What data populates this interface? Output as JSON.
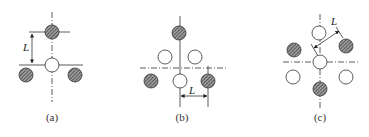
{
  "figure": {
    "background": "#ffffff",
    "line_color": "#333333",
    "hatch_fill": "#6e6e6e",
    "panels": [
      {
        "id": "a",
        "caption": "(a)",
        "caption_pos": [
          52,
          118
        ],
        "dimension": {
          "label": "L",
          "label_pos": [
            27,
            46
          ]
        },
        "circles": [
          {
            "x": 52,
            "y": 32,
            "type": "hatched"
          },
          {
            "x": 52,
            "y": 65,
            "type": "open"
          },
          {
            "x": 26,
            "y": 75,
            "type": "hatched"
          },
          {
            "x": 75,
            "y": 75,
            "type": "hatched"
          }
        ]
      },
      {
        "id": "b",
        "caption": "(b)",
        "caption_pos": [
          182,
          118
        ],
        "dimension": {
          "label": "L",
          "label_pos": [
            190,
            85
          ]
        },
        "circles": [
          {
            "x": 179,
            "y": 33,
            "type": "hatched"
          },
          {
            "x": 165,
            "y": 57,
            "type": "open"
          },
          {
            "x": 195,
            "y": 57,
            "type": "open"
          },
          {
            "x": 151,
            "y": 81,
            "type": "hatched"
          },
          {
            "x": 180,
            "y": 81,
            "type": "open"
          },
          {
            "x": 208,
            "y": 81,
            "type": "hatched"
          }
        ]
      },
      {
        "id": "c",
        "caption": "(c)",
        "caption_pos": [
          320,
          118
        ],
        "dimension": {
          "label": "L",
          "label_pos": [
            332,
            25
          ]
        },
        "circles": [
          {
            "x": 319,
            "y": 33,
            "type": "open"
          },
          {
            "x": 294,
            "y": 50,
            "type": "hatched"
          },
          {
            "x": 346,
            "y": 46,
            "type": "hatched"
          },
          {
            "x": 320,
            "y": 62,
            "type": "open"
          },
          {
            "x": 293,
            "y": 77,
            "type": "open"
          },
          {
            "x": 346,
            "y": 77,
            "type": "open"
          },
          {
            "x": 320,
            "y": 89,
            "type": "hatched"
          }
        ]
      }
    ]
  }
}
